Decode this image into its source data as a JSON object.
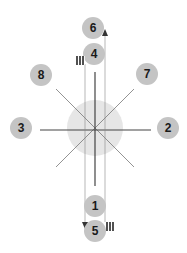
{
  "diagram": {
    "center": {
      "x": 95,
      "y": 128
    },
    "center_disc": {
      "radius": 28,
      "color": "#e6e6e6"
    },
    "line_color": "#555555",
    "badge_color": "#c4c4c4",
    "badges": [
      {
        "label": "1",
        "x": 95,
        "y": 206
      },
      {
        "label": "2",
        "x": 168,
        "y": 128
      },
      {
        "label": "3",
        "x": 21,
        "y": 128
      },
      {
        "label": "4",
        "x": 94,
        "y": 54
      },
      {
        "label": "5",
        "x": 95,
        "y": 231
      },
      {
        "label": "6",
        "x": 93,
        "y": 28
      },
      {
        "label": "7",
        "x": 147,
        "y": 74
      },
      {
        "label": "8",
        "x": 41,
        "y": 75
      }
    ],
    "icons": [
      {
        "name": "qr-code-icon",
        "x": 76,
        "y": 56
      },
      {
        "name": "qr-code-icon",
        "x": 106,
        "y": 222
      }
    ],
    "arrows": [
      {
        "direction": "up",
        "x": 105,
        "y": 33
      },
      {
        "direction": "down",
        "x": 85,
        "y": 225
      }
    ]
  }
}
